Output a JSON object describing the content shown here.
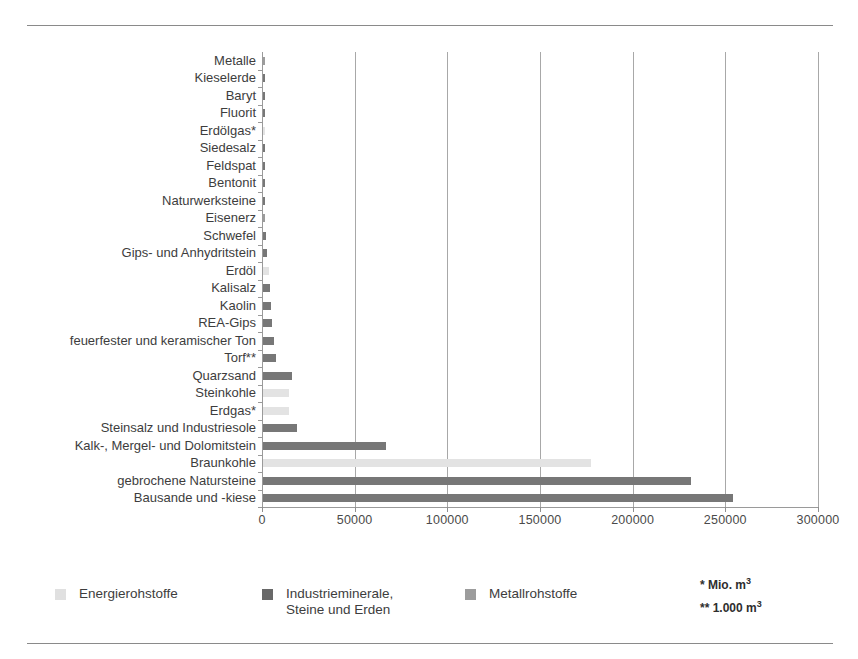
{
  "chart_data": {
    "type": "bar",
    "orientation": "horizontal",
    "title": "",
    "subtitle": "",
    "xlabel": "",
    "ylabel": "",
    "xlim": [
      0,
      300000
    ],
    "xtick_labels": [
      "0",
      "50000",
      "100000",
      "150000",
      "200000",
      "250000",
      "300000"
    ],
    "xticks": [
      0,
      50000,
      100000,
      150000,
      200000,
      250000,
      300000
    ],
    "grid": true,
    "legend_position": "bottom-left",
    "legend": [
      {
        "label": "Energierohstoffe",
        "color": "#e0e0e0",
        "key": "energie"
      },
      {
        "label": "Industrieminerale,\nSteine und Erden",
        "color": "#686868",
        "key": "industrie"
      },
      {
        "label": "Metallrohstoffe",
        "color": "#9c9c9c",
        "key": "metall"
      }
    ],
    "annotations": [
      "* Mio. m³",
      "** 1.000 m³"
    ],
    "categories": [
      "Metalle",
      "Kieselerde",
      "Baryt",
      "Fluorit",
      "Erdölgas*",
      "Siedesalz",
      "Feldspat",
      "Bentonit",
      "Naturwerksteine",
      "Eisenerz",
      "Schwefel",
      "Gips- und Anhydritstein",
      "Erdöl",
      "Kalisalz",
      "Kaolin",
      "REA-Gips",
      "feuerfester und keramischer Ton",
      "Torf**",
      "Quarzsand",
      "Steinkohle",
      "Erdgas*",
      "Steinsalz und Industriesole",
      "Kalk-, Mergel- und Dolomitstein",
      "Braunkohle",
      "gebrochene Natursteine",
      "Bausande und -kiese"
    ],
    "values": [
      60,
      120,
      180,
      260,
      360,
      480,
      620,
      780,
      950,
      1150,
      1400,
      2100,
      3000,
      3600,
      4300,
      5100,
      5900,
      6800,
      15600,
      14000,
      14000,
      18400,
      66400,
      177000,
      231000,
      253600
    ],
    "series_keys": [
      "metall",
      "industrie",
      "industrie",
      "industrie",
      "energie",
      "industrie",
      "industrie",
      "industrie",
      "industrie",
      "metall",
      "industrie",
      "industrie",
      "energie",
      "industrie",
      "industrie",
      "industrie",
      "industrie",
      "industrie",
      "industrie",
      "energie",
      "energie",
      "industrie",
      "industrie",
      "energie",
      "industrie",
      "industrie"
    ]
  }
}
